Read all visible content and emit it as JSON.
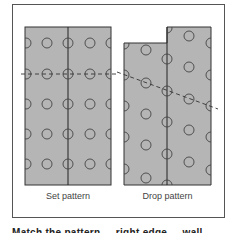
{
  "figure": {
    "panels": [
      {
        "id": "set",
        "caption": "Set pattern"
      },
      {
        "id": "drop",
        "caption": "Drop pattern"
      }
    ],
    "colors": {
      "panel_fill": "#b5b5b5",
      "outline": "#333333",
      "circle": "#444444",
      "frame": "#555555"
    },
    "footer_text_clipped": "Match the pattern ... right edge ... wall ..."
  }
}
